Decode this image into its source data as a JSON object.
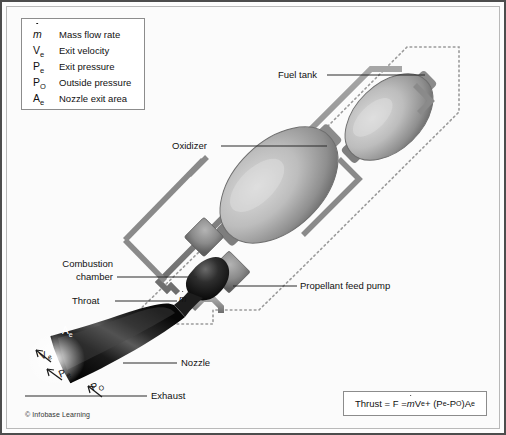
{
  "figure": {
    "copyright": "© Infobase Learning"
  },
  "legend": {
    "rows": [
      {
        "symbol": "m",
        "symbol_sub": "",
        "dot": true,
        "text": "Mass flow rate"
      },
      {
        "symbol": "V",
        "symbol_sub": "e",
        "dot": false,
        "text": "Exit velocity"
      },
      {
        "symbol": "P",
        "symbol_sub": "e",
        "dot": false,
        "text": "Exit pressure"
      },
      {
        "symbol": "P",
        "symbol_sub": "O",
        "dot": false,
        "text": "Outside pressure"
      },
      {
        "symbol": "A",
        "symbol_sub": "e",
        "dot": false,
        "text": "Nozzle exit area"
      }
    ]
  },
  "formula": {
    "text": "Thrust = F = mVe + (Pe - PO)Ae",
    "parts": {
      "lead": "Thrust = F = ",
      "mdot": "m",
      "v": "V",
      "v_sub": "e",
      "plus": " + (",
      "pe": "P",
      "pe_sub": "e",
      "minus": " - ",
      "po": "P",
      "po_sub": "O",
      "close": ")",
      "a": "A",
      "a_sub": "e"
    }
  },
  "callouts": {
    "fuel_tank": "Fuel tank",
    "oxidizer": "Oxidizer",
    "combustion_chamber_line1": "Combustion",
    "combustion_chamber_line2": "chamber",
    "throat": "Throat",
    "propellant_feed_pump": "Propellant feed pump",
    "nozzle": "Nozzle",
    "exhaust": "Exhaust"
  },
  "annotations": {
    "mdot": "m",
    "ae": "A",
    "ae_sub": "e",
    "ve": "V",
    "ve_sub": "e",
    "pe": "P",
    "pe_sub": "e",
    "po": "P",
    "po_sub": "O"
  },
  "colors": {
    "frame": "#4d4d4d",
    "background": "#fbfbfb",
    "tank_light": "#d2d2d2",
    "tank_dark": "#6f6f6f",
    "pipe": "#8a8a8a",
    "nozzle_dark": "#101010",
    "outline_dotted": "#9a9a9a",
    "text": "#111111"
  }
}
